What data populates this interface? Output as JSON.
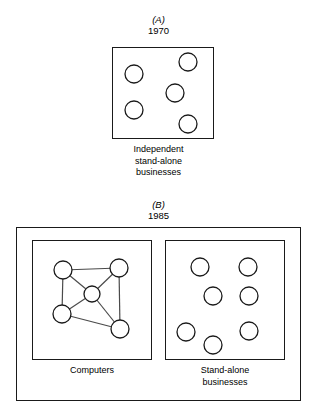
{
  "figure": {
    "background_color": "#ffffff",
    "line_color": "#1a1a1a",
    "edge_color": "#4a4a4a",
    "width": 317,
    "height": 416
  },
  "panel_a": {
    "letter": "(A)",
    "year": "1970",
    "caption_line1": "Independent",
    "caption_line2": "stand-alone",
    "caption_line3": "businesses",
    "box": {
      "x": 112,
      "y": 47,
      "w": 102,
      "h": 92
    },
    "circles": [
      {
        "cx": 134,
        "cy": 74,
        "r": 9
      },
      {
        "cx": 188,
        "cy": 62,
        "r": 9
      },
      {
        "cx": 175,
        "cy": 93,
        "r": 9
      },
      {
        "cx": 134,
        "cy": 110,
        "r": 9
      },
      {
        "cx": 188,
        "cy": 124,
        "r": 9
      }
    ]
  },
  "panel_b": {
    "letter": "(B)",
    "year": "1985",
    "outer_box": {
      "x": 16,
      "y": 227,
      "w": 285,
      "h": 174
    },
    "computers": {
      "caption": "Computers",
      "box": {
        "x": 32,
        "y": 240,
        "w": 120,
        "h": 120
      },
      "nodes": [
        {
          "id": "top-left",
          "cx": 63,
          "cy": 270,
          "r": 9
        },
        {
          "id": "top-right",
          "cx": 119,
          "cy": 268,
          "r": 9
        },
        {
          "id": "center",
          "cx": 92,
          "cy": 294,
          "r": 8
        },
        {
          "id": "bottom-left",
          "cx": 62,
          "cy": 314,
          "r": 9
        },
        {
          "id": "bottom-right",
          "cx": 120,
          "cy": 329,
          "r": 9
        }
      ],
      "edges": [
        {
          "from": "top-left",
          "to": "top-right"
        },
        {
          "from": "top-left",
          "to": "bottom-left"
        },
        {
          "from": "top-left",
          "to": "center"
        },
        {
          "from": "top-right",
          "to": "center"
        },
        {
          "from": "top-right",
          "to": "bottom-right"
        },
        {
          "from": "center",
          "to": "bottom-left"
        },
        {
          "from": "center",
          "to": "bottom-right"
        },
        {
          "from": "bottom-left",
          "to": "bottom-right"
        }
      ]
    },
    "standalone": {
      "caption_line1": "Stand-alone",
      "caption_line2": "businesses",
      "box": {
        "x": 165,
        "y": 240,
        "w": 120,
        "h": 120
      },
      "circles": [
        {
          "cx": 200,
          "cy": 267,
          "r": 9
        },
        {
          "cx": 248,
          "cy": 267,
          "r": 9
        },
        {
          "cx": 213,
          "cy": 296,
          "r": 9
        },
        {
          "cx": 249,
          "cy": 296,
          "r": 9
        },
        {
          "cx": 186,
          "cy": 332,
          "r": 9
        },
        {
          "cx": 213,
          "cy": 345,
          "r": 9
        },
        {
          "cx": 249,
          "cy": 331,
          "r": 9
        }
      ]
    }
  }
}
